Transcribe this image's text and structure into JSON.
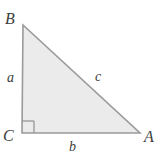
{
  "figure": {
    "type": "right-triangle-diagram",
    "background_color": "#ffffff",
    "fill_color": "#ebebeb",
    "stroke_color": "#9a9a9a",
    "label_color": "#3d3d3d",
    "vertices": {
      "B": {
        "label": "B",
        "x": 23,
        "y": 25
      },
      "C": {
        "label": "C",
        "x": 22,
        "y": 133
      },
      "A": {
        "label": "A",
        "x": 140,
        "y": 133
      }
    },
    "sides": {
      "a": {
        "label": "a",
        "description": "vertical leg from C to B"
      },
      "b": {
        "label": "b",
        "description": "horizontal leg from C to A"
      },
      "c": {
        "label": "c",
        "description": "hypotenuse from B to A"
      }
    },
    "right_angle": {
      "at_vertex": "C",
      "marker": "square",
      "size": 12
    }
  }
}
